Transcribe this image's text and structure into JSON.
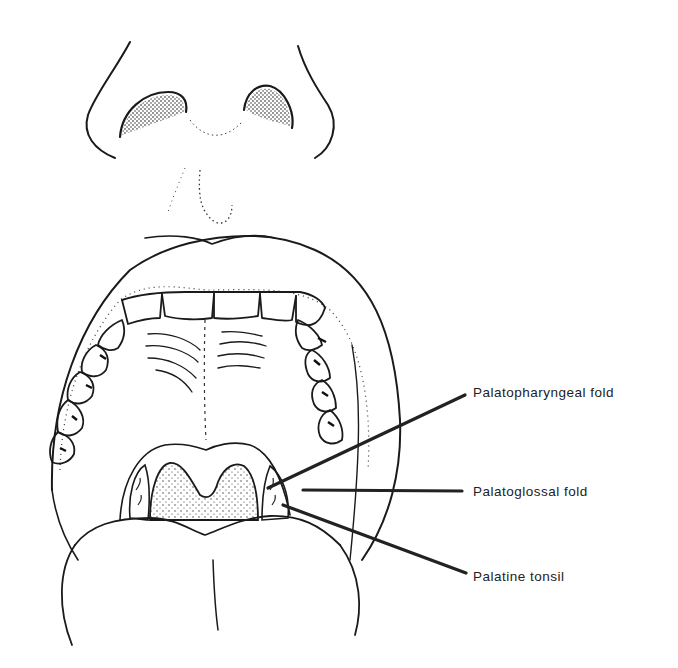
{
  "figure": {
    "labels": [
      {
        "id": "palatopharyngeal",
        "text": "Palatopharyngeal fold",
        "x": 473,
        "y": 385
      },
      {
        "id": "palatoglossal",
        "text": "Palatoglossal fold",
        "x": 473,
        "y": 484
      },
      {
        "id": "palatine-tonsil",
        "text": "Palatine tonsil",
        "x": 473,
        "y": 569
      }
    ],
    "leaders": [
      {
        "from": [
          268,
          488
        ],
        "to": [
          465,
          395
        ]
      },
      {
        "from": [
          303,
          490
        ],
        "to": [
          462,
          491
        ]
      },
      {
        "from": [
          283,
          505
        ],
        "to": [
          466,
          573
        ]
      }
    ]
  }
}
